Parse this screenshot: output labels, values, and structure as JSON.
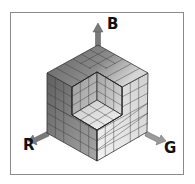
{
  "diagram": {
    "type": "isometric-color-cube",
    "axes": [
      {
        "key": "B",
        "label": "B",
        "direction": "up"
      },
      {
        "key": "R",
        "label": "R",
        "direction": "down-left"
      },
      {
        "key": "G",
        "label": "G",
        "direction": "down-right"
      }
    ],
    "grid_divisions": 6,
    "colors": {
      "frame": "#8a8a8a",
      "grid_line": "#3a3a3a",
      "arrow": "#7a7a7a",
      "left_face_dark": "#5e5e5e",
      "left_face_light": "#a8a8a8",
      "right_face_light": "#efefef",
      "right_face_mid": "#d2d2d2",
      "top_face_dark": "#6c6c6c",
      "top_face_light": "#d0d0d0"
    }
  }
}
